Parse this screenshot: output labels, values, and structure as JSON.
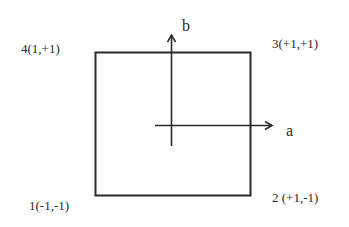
{
  "diagram": {
    "axes": {
      "horizontal_label": "a",
      "vertical_label": "b"
    },
    "corners": [
      {
        "id": 1,
        "label": "1(-1,-1)"
      },
      {
        "id": 2,
        "label": "2 (+1,-1)"
      },
      {
        "id": 3,
        "label": "3(+1,+1)"
      },
      {
        "id": 4,
        "label": "4(1,+1)"
      }
    ],
    "colors": {
      "stroke": "#2a2a2a",
      "background": "#ffffff"
    }
  }
}
